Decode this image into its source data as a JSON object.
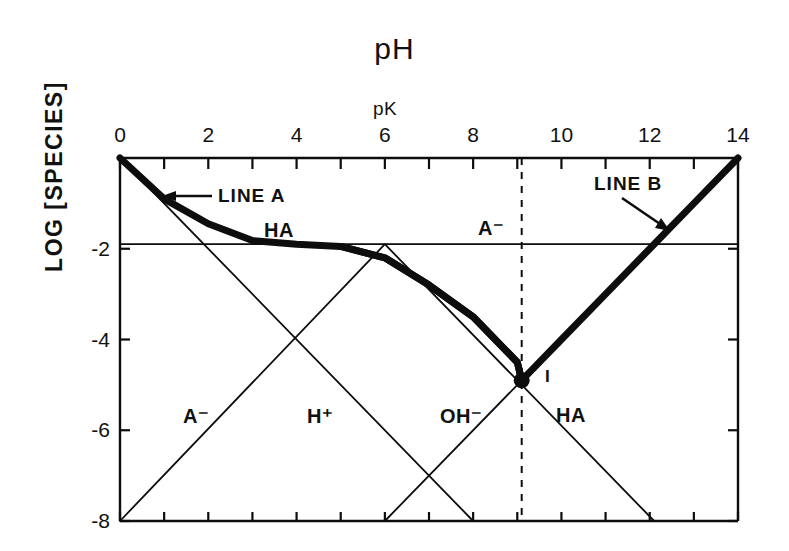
{
  "title": "pH",
  "axis": {
    "x_secondary_label": "pK",
    "x_secondary_at": 6,
    "y_title": "LOG [SPECIES]",
    "x_ticks": [
      {
        "value": 0,
        "label": "0"
      },
      {
        "value": 1,
        "label": ""
      },
      {
        "value": 2,
        "label": "2"
      },
      {
        "value": 3,
        "label": ""
      },
      {
        "value": 4,
        "label": "4"
      },
      {
        "value": 5,
        "label": ""
      },
      {
        "value": 6,
        "label": "6"
      },
      {
        "value": 7,
        "label": ""
      },
      {
        "value": 8,
        "label": "8"
      },
      {
        "value": 9,
        "label": ""
      },
      {
        "value": 10,
        "label": "10"
      },
      {
        "value": 11,
        "label": ""
      },
      {
        "value": 12,
        "label": "12"
      },
      {
        "value": 13,
        "label": ""
      },
      {
        "value": 14,
        "label": "14"
      }
    ],
    "y_ticks": [
      {
        "value": -2,
        "label": "-2"
      },
      {
        "value": -4,
        "label": "-4"
      },
      {
        "value": -6,
        "label": "-6"
      },
      {
        "value": -8,
        "label": "-8"
      }
    ]
  },
  "annotations": {
    "line_a": "LINE A",
    "line_b": "LINE B",
    "ha_plateau": "HA",
    "a_minus_plateau": "A⁻",
    "a_minus_rising": "A⁻",
    "h_plus": "H⁺",
    "oh_minus": "OH⁻",
    "ha_falling": "HA",
    "equivalence_marker": "I"
  },
  "chart_data": {
    "type": "line",
    "title": "pH",
    "xlabel": "pH",
    "ylabel": "LOG [SPECIES]",
    "xlim": [
      0,
      14
    ],
    "ylim": [
      -8,
      0
    ],
    "grid": false,
    "legend": "inline-annotations",
    "pK": 6,
    "pKw": 14,
    "log_total_concentration": -1.9,
    "equivalence_point": {
      "pH": 9.1,
      "log": -4.9
    },
    "series": [
      {
        "name": "H+",
        "style": "thin",
        "points": [
          [
            0,
            0
          ],
          [
            8,
            -8
          ]
        ]
      },
      {
        "name": "OH-",
        "style": "thin",
        "points": [
          [
            6,
            -8
          ],
          [
            14,
            0
          ]
        ]
      },
      {
        "name": "HA",
        "style": "thin",
        "points": [
          [
            0,
            -1.9
          ],
          [
            6,
            -1.9
          ],
          [
            12.1,
            -8
          ]
        ]
      },
      {
        "name": "A-",
        "style": "thin",
        "points": [
          [
            0,
            -8
          ],
          [
            6,
            -1.9
          ],
          [
            14,
            -1.9
          ]
        ]
      },
      {
        "name": "LINE A",
        "style": "bold",
        "points": [
          [
            0,
            0
          ],
          [
            1,
            -0.9
          ],
          [
            2,
            -1.45
          ],
          [
            3,
            -1.82
          ],
          [
            4,
            -1.9
          ],
          [
            5,
            -1.95
          ],
          [
            6,
            -2.2
          ],
          [
            7,
            -2.8
          ],
          [
            8,
            -3.5
          ],
          [
            9,
            -4.5
          ],
          [
            9.1,
            -4.9
          ]
        ]
      },
      {
        "name": "LINE B",
        "style": "bold",
        "points": [
          [
            5,
            -1.95
          ],
          [
            6,
            -2.2
          ],
          [
            7,
            -2.8
          ],
          [
            8,
            -3.5
          ],
          [
            9,
            -4.5
          ],
          [
            9.1,
            -4.9
          ],
          [
            10,
            -4.0
          ],
          [
            11,
            -3.0
          ],
          [
            12,
            -2.0
          ],
          [
            13,
            -1.0
          ],
          [
            14,
            0
          ]
        ]
      }
    ],
    "reference_lines": [
      {
        "name": "equivalence-dashed",
        "type": "vertical",
        "x": 9.1,
        "style": "dashed"
      }
    ]
  },
  "colors": {
    "ink": "#0d0d0d",
    "background": "#ffffff"
  }
}
